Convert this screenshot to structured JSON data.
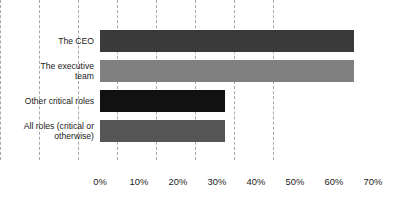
{
  "chart_data": {
    "type": "bar",
    "orientation": "horizontal",
    "title": "",
    "xlabel": "",
    "ylabel": "",
    "categories": [
      "The CEO",
      "The  executive\nteam",
      "Other critical roles",
      "All roles (critical or\notherwise)"
    ],
    "values": [
      65,
      65,
      32,
      32
    ],
    "value_suffix": "%",
    "xlim": [
      0,
      70
    ],
    "xticks": [
      0,
      10,
      20,
      30,
      40,
      50,
      60,
      70
    ],
    "xtick_labels": [
      "0%",
      "10%",
      "20%",
      "30%",
      "40%",
      "50%",
      "60%",
      "70%"
    ],
    "grid": {
      "vertical": true,
      "horizontal": false,
      "style": "dashed",
      "color": "#a8a8a8"
    },
    "legend": {
      "visible": false,
      "position": "none"
    },
    "bar_colors": [
      "#3a3a3a",
      "#808080",
      "#111111",
      "#555555"
    ],
    "background_color": "#ffffff",
    "text_color": "#1a1a1a"
  }
}
